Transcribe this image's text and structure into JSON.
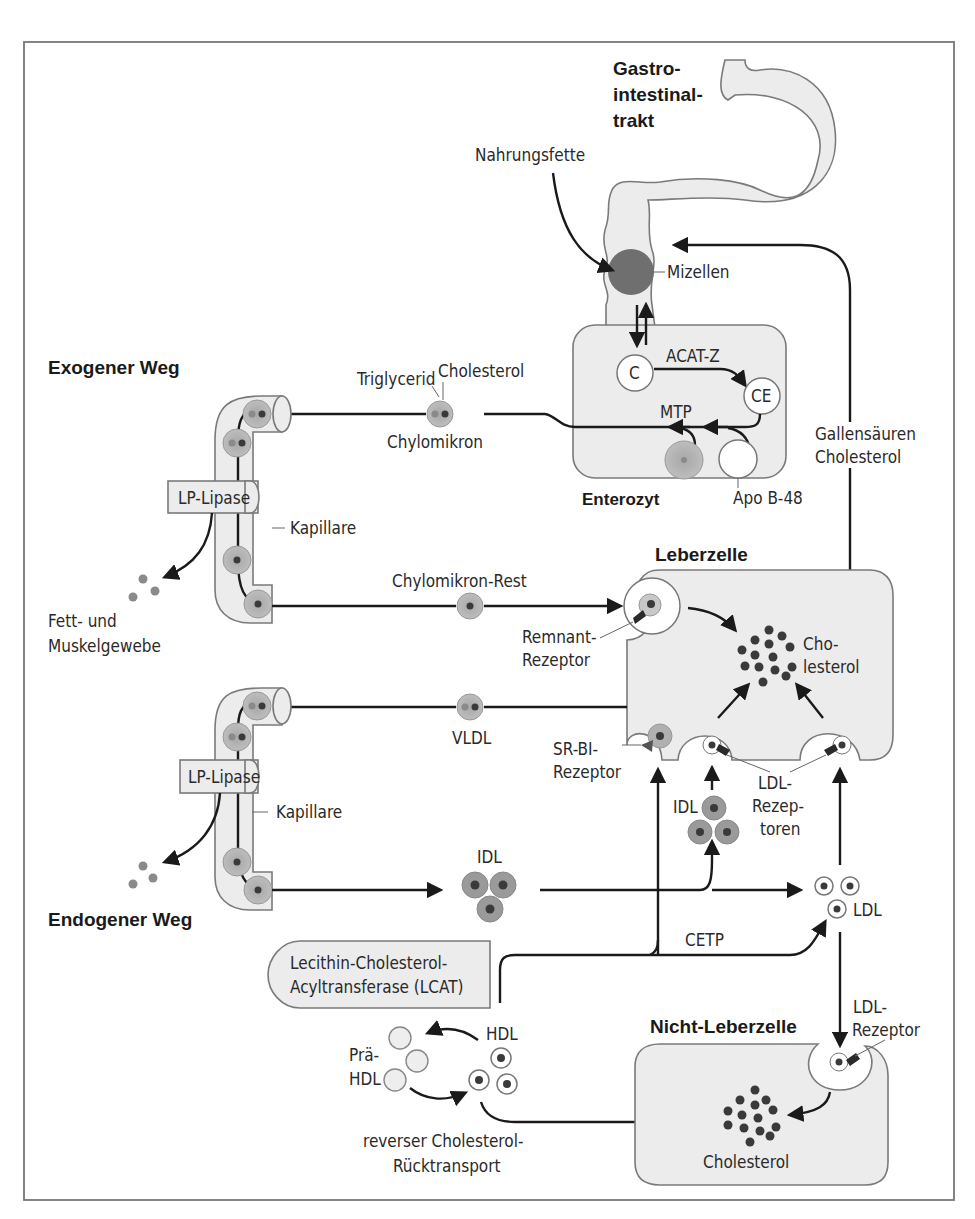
{
  "sections": {
    "gi_tract": [
      "Gastro-",
      "intestinal-",
      "trakt"
    ],
    "exogenous": "Exogener Weg",
    "endogenous": "Endogener Weg",
    "enterocyte": "Enterozyt",
    "liver_cell": "Leberzelle",
    "non_liver_cell": "Nicht-Leberzelle"
  },
  "labels": {
    "dietary_fats": "Nahrungsfette",
    "micelles": "Mizellen",
    "c": "C",
    "ce": "CE",
    "acat": "ACAT-Z",
    "mtp": "MTP",
    "apo_b48": "Apo B-48",
    "triglyceride": "Triglycerid",
    "cholesterol": "Cholesterol",
    "chylomicron": "Chylomikron",
    "lp_lipase": "LP-Lipase",
    "capillary": "Kapillare",
    "fat_muscle": [
      "Fett- und",
      "Muskelgewebe"
    ],
    "chylo_rest": "Chylomikron-Rest",
    "remnant_receptor": [
      "Remnant-",
      "Rezeptor"
    ],
    "bile": [
      "Gallensäuren",
      "Cholesterol"
    ],
    "liver_chol": [
      "Cho-",
      "lesterol"
    ],
    "vldl": "VLDL",
    "srbi": [
      "SR-BI-",
      "Rezeptor"
    ],
    "idl": "IDL",
    "ldl_receptors": [
      "LDL-",
      "Rezep-",
      "toren"
    ],
    "ldl": "LDL",
    "cetp": "CETP",
    "lcat": [
      "Lecithin-Cholesterol-",
      "Acyltransferase (LCAT)"
    ],
    "hdl": "HDL",
    "pre_hdl": [
      "Prä-",
      "HDL"
    ],
    "reverse_transport": [
      "reverser Cholesterol-",
      "Rücktransport"
    ],
    "ldl_receptor": [
      "LDL-",
      "Rezeptor"
    ],
    "nonliver_chol": "Cholesterol"
  },
  "colors": {
    "cell_fill": "#ececec",
    "lipoprotein_fill": "#b5b5b5",
    "micelle_fill": "#6f6f6f",
    "core_dark": "#3a3a3a",
    "line": "#1a1a1a"
  }
}
